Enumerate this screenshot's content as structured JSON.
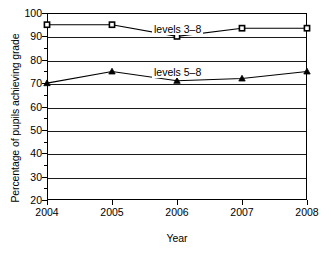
{
  "chart_data": {
    "type": "line",
    "title": "",
    "xlabel": "Year",
    "ylabel": "Percentage of pupils achieving grade",
    "categories": [
      "2004",
      "2005",
      "2006",
      "2007",
      "2008"
    ],
    "x": [
      2004,
      2005,
      2006,
      2007,
      2008
    ],
    "xlim": [
      2004,
      2008
    ],
    "ylim": [
      20,
      100
    ],
    "y_ticks": [
      100,
      90,
      80,
      70,
      60,
      50,
      40,
      30,
      20
    ],
    "y_minor_ticks": [
      95,
      85,
      75,
      65,
      55,
      45,
      35,
      25
    ],
    "grid": "horizontal",
    "legend_position": "inline-labels",
    "series": [
      {
        "name": "levels 3–8",
        "marker": "square",
        "color": "#000000",
        "values": [
          95,
          95,
          90,
          93.5,
          93.5
        ]
      },
      {
        "name": "levels 5–8",
        "marker": "triangle",
        "color": "#000000",
        "values": [
          70,
          75,
          71,
          72,
          75
        ]
      }
    ],
    "annotations": [
      {
        "text": "levels 3–8",
        "near_series": 0
      },
      {
        "text": "levels 5–8",
        "near_series": 1
      }
    ]
  }
}
